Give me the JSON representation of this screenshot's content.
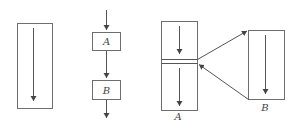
{
  "diagram": {
    "panel1": {
      "type": "single-block-sequential-flow"
    },
    "panel2": {
      "type": "sequential-blocks",
      "blocks": [
        {
          "label": "A"
        },
        {
          "label": "B"
        }
      ]
    },
    "panel3": {
      "type": "call-and-return",
      "caller": {
        "label": "A"
      },
      "callee": {
        "label": "B"
      },
      "edges": [
        {
          "from": "A",
          "to": "B",
          "meaning": "call"
        },
        {
          "from": "B",
          "to": "A",
          "meaning": "return"
        }
      ]
    },
    "colors": {
      "stroke": "#6e6e6e",
      "text": "#444444",
      "background": "#ffffff"
    }
  }
}
